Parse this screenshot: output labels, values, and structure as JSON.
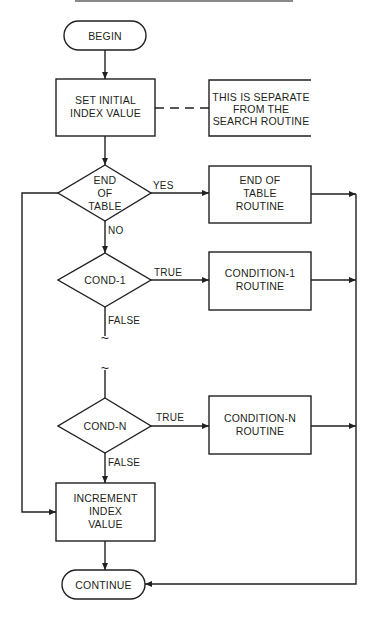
{
  "diagram": {
    "type": "flowchart",
    "colors": {
      "stroke": "#231f20",
      "background": "#ffffff",
      "top_rule": "#8a8a8a"
    },
    "nodes": {
      "begin": {
        "shape": "terminal",
        "lines": [
          "BEGIN"
        ]
      },
      "set_initial": {
        "shape": "process",
        "lines": [
          "SET INITIAL",
          "INDEX VALUE"
        ]
      },
      "note": {
        "shape": "annotation",
        "lines": [
          "THIS IS SEPARATE",
          "FROM THE",
          "SEARCH ROUTINE"
        ]
      },
      "end_of_table": {
        "shape": "decision",
        "lines": [
          "END",
          "OF",
          "TABLE"
        ]
      },
      "end_of_table_routine": {
        "shape": "process",
        "lines": [
          "END OF",
          "TABLE",
          "ROUTINE"
        ]
      },
      "cond_1": {
        "shape": "decision",
        "lines": [
          "COND-1"
        ]
      },
      "condition_1_routine": {
        "shape": "process",
        "lines": [
          "CONDITION-1",
          "ROUTINE"
        ]
      },
      "cond_n": {
        "shape": "decision",
        "lines": [
          "COND-N"
        ]
      },
      "condition_n_routine": {
        "shape": "process",
        "lines": [
          "CONDITION-N",
          "ROUTINE"
        ]
      },
      "increment": {
        "shape": "process",
        "lines": [
          "INCREMENT",
          "INDEX",
          "VALUE"
        ]
      },
      "continue": {
        "shape": "terminal",
        "lines": [
          "CONTINUE"
        ]
      }
    },
    "edge_labels": {
      "end_yes": "YES",
      "end_no": "NO",
      "cond1_true": "TRUE",
      "cond1_false": "FALSE",
      "condn_true": "TRUE",
      "condn_false": "FALSE"
    },
    "break_marker": "~",
    "edges": [
      [
        "begin",
        "set_initial"
      ],
      [
        "set_initial",
        "note",
        "dashed"
      ],
      [
        "set_initial",
        "end_of_table"
      ],
      [
        "end_of_table",
        "end_of_table_routine",
        "YES"
      ],
      [
        "end_of_table",
        "cond_1",
        "NO"
      ],
      [
        "end_of_table",
        "increment",
        "left-loop"
      ],
      [
        "cond_1",
        "condition_1_routine",
        "TRUE"
      ],
      [
        "cond_1",
        "cond_n",
        "FALSE (omitted)"
      ],
      [
        "cond_n",
        "condition_n_routine",
        "TRUE"
      ],
      [
        "cond_n",
        "increment",
        "FALSE"
      ],
      [
        "increment",
        "continue"
      ],
      [
        "end_of_table_routine",
        "continue"
      ],
      [
        "condition_1_routine",
        "continue"
      ],
      [
        "condition_n_routine",
        "continue"
      ]
    ]
  }
}
